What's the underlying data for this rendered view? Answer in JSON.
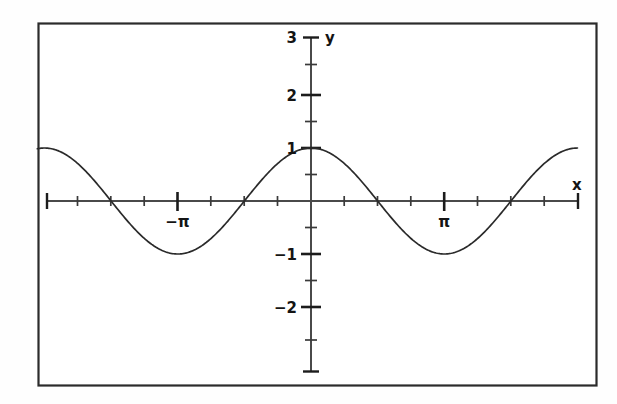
{
  "figure": {
    "title": "",
    "background_color": "#ffffff",
    "frame_color": "#2b2b2b",
    "curve_color": "#2a2a2a",
    "axis_color": "#4a4a4a"
  },
  "axes": {
    "x_axis_label": "x",
    "y_axis_label": "y",
    "x_tick_labels": [
      {
        "text": "−π",
        "value": -3.14159
      },
      {
        "text": "π",
        "value": 3.14159
      }
    ],
    "y_tick_labels": [
      {
        "text": "3",
        "value": 3
      },
      {
        "text": "2",
        "value": 2
      },
      {
        "text": "1",
        "value": 1
      },
      {
        "text": "−1",
        "value": -1
      },
      {
        "text": "−2",
        "value": -2
      }
    ]
  },
  "chart_data": {
    "type": "line",
    "title": "",
    "xlabel": "x",
    "ylabel": "y",
    "xlim": [
      -6.45,
      6.28
    ],
    "ylim": [
      -2.75,
      3.0
    ],
    "grid": false,
    "legend": null,
    "function": "y = cos(x)",
    "x_tick_values": [
      -6.28319,
      -5.49779,
      -4.71239,
      -3.92699,
      -3.14159,
      -2.35619,
      -1.5708,
      -0.785398,
      0.785398,
      1.5708,
      2.35619,
      3.14159,
      3.92699,
      4.71239,
      5.49779,
      6.28319
    ],
    "x_major_ticks": [
      -3.14159,
      3.14159
    ],
    "y_tick_values": [
      3,
      2.5,
      2,
      1.5,
      1,
      0.5,
      -0.5,
      -1,
      -1.5,
      -2,
      -2.5
    ],
    "x": [
      -6.45,
      -6.2,
      -5.95,
      -5.7,
      -5.45,
      -5.2,
      -4.95,
      -4.7,
      -4.45,
      -4.2,
      -3.95,
      -3.7,
      -3.45,
      -3.2,
      -2.95,
      -2.7,
      -2.45,
      -2.2,
      -1.95,
      -1.7,
      -1.45,
      -1.2,
      -0.95,
      -0.7,
      -0.45,
      -0.2,
      0.05,
      0.3,
      0.55,
      0.8,
      1.05,
      1.3,
      1.55,
      1.8,
      2.05,
      2.3,
      2.55,
      2.8,
      3.05,
      3.3,
      3.55,
      3.8,
      4.05,
      4.3,
      4.55,
      4.8,
      5.05,
      5.3,
      5.55,
      5.8,
      6.05,
      6.28
    ],
    "y": [
      0.9945,
      0.9965,
      0.9391,
      0.8347,
      0.6888,
      0.5085,
      0.3035,
      0.085,
      -0.1245,
      -0.4903,
      -0.6927,
      -0.8562,
      -0.9556,
      -0.9983,
      -0.9813,
      -0.9041,
      -0.7702,
      -0.5885,
      -0.3702,
      -0.1288,
      0.1197,
      0.3624,
      0.5817,
      0.7648,
      0.9004,
      0.9801,
      0.9988,
      0.9553,
      0.8525,
      0.6967,
      0.4976,
      0.2675,
      0.0208,
      -0.2272,
      -0.4611,
      -0.6663,
      -0.8309,
      -0.9422,
      -0.9963,
      -0.9875,
      -0.919,
      -0.791,
      -0.6122,
      -0.3959,
      -0.1593,
      0.0875,
      0.3248,
      0.5544,
      0.7473,
      0.8891,
      0.9747,
      1.0
    ],
    "series": [
      {
        "name": "cos(x)",
        "color": "#2a2a2a",
        "amplitude": 1,
        "period": 6.28319,
        "maxima_at": [
          -6.28319,
          0,
          6.28319
        ],
        "minima_at": [
          -3.14159,
          3.14159
        ],
        "zeros_at": [
          -4.71239,
          -1.5708,
          1.5708,
          4.71239
        ]
      }
    ]
  }
}
